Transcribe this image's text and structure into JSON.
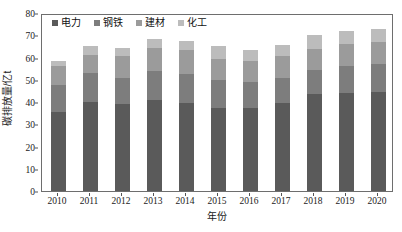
{
  "chart_data": {
    "type": "bar",
    "subtype": "stacked-bar",
    "title": "",
    "xlabel": "年份",
    "ylabel": "碳排放量/亿t",
    "categories": [
      "2010",
      "2011",
      "2012",
      "2013",
      "2014",
      "2015",
      "2016",
      "2017",
      "2018",
      "2019",
      "2020"
    ],
    "series": [
      {
        "name": "电力",
        "color": "#5a5a5a",
        "values": [
          35.5,
          40.0,
          39.0,
          41.0,
          39.5,
          37.5,
          37.5,
          39.5,
          43.5,
          44.0,
          44.5
        ]
      },
      {
        "name": "钢铁",
        "color": "#7d7d7d",
        "values": [
          12.0,
          13.0,
          12.0,
          13.0,
          13.0,
          12.5,
          11.5,
          11.5,
          11.0,
          12.0,
          12.5
        ]
      },
      {
        "name": "建材",
        "color": "#9b9b9b",
        "values": [
          8.5,
          8.0,
          9.5,
          10.5,
          11.0,
          9.5,
          9.5,
          9.5,
          9.5,
          10.0,
          10.0
        ]
      },
      {
        "name": "化工",
        "color": "#bcbcbc",
        "values": [
          2.5,
          4.0,
          4.0,
          4.0,
          4.0,
          5.5,
          5.0,
          5.0,
          6.0,
          6.0,
          6.0
        ]
      }
    ],
    "totals": [
      58.5,
      65.0,
      64.5,
      68.5,
      67.5,
      65.0,
      63.5,
      65.5,
      70.0,
      72.0,
      73.0
    ],
    "ylim": [
      0,
      80
    ],
    "yticks": [
      0,
      10,
      20,
      30,
      40,
      50,
      60,
      70,
      80
    ],
    "grid": false,
    "legend_position": "top-left",
    "axis_color": "#6e6e6e"
  },
  "legend": {
    "items": [
      {
        "label": "电力"
      },
      {
        "label": "钢铁"
      },
      {
        "label": "建材"
      },
      {
        "label": "化工"
      }
    ]
  },
  "axes": {
    "x_title": "年份",
    "y_title": "碳排放量/亿t"
  }
}
